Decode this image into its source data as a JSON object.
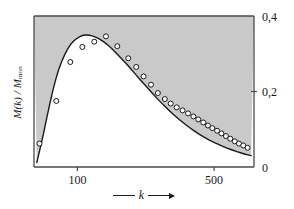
{
  "chart_data": {
    "type": "line",
    "title": "",
    "subtitle": "",
    "xlabel": "k",
    "xlabel_arrow": "⟶",
    "ylabel": "M(k) / M_mon",
    "ylabel_main": "M(k) / M",
    "ylabel_sub": "mon",
    "xscale": "log",
    "xlim": [
      60,
      800
    ],
    "ylim": [
      0,
      0.4
    ],
    "x_ticks": [
      100,
      500
    ],
    "x_tick_labels": [
      "100",
      "500"
    ],
    "y_ticks": [
      0,
      0.2,
      0.4
    ],
    "y_tick_labels": [
      "0",
      "0,2",
      "0,4"
    ],
    "y_axis_position": "right",
    "grid": false,
    "legend": false,
    "shaded_region": {
      "label": "area above curve",
      "color": "#c9c9c9",
      "description": "gray fill between the curve and the top/right frame"
    },
    "series": [
      {
        "name": "model curve",
        "type": "line",
        "color": "#1a1a1a",
        "linewidth": 1.4,
        "x": [
          62,
          66,
          70,
          75,
          80,
          86,
          92,
          99,
          106,
          114,
          122,
          131,
          141,
          151,
          162,
          174,
          187,
          200,
          215,
          231,
          248,
          266,
          286,
          307,
          330,
          354,
          380,
          408,
          438,
          470,
          505,
          542,
          582,
          625,
          671,
          720,
          773
        ],
        "y": [
          0.012,
          0.07,
          0.135,
          0.205,
          0.258,
          0.298,
          0.325,
          0.341,
          0.349,
          0.35,
          0.346,
          0.338,
          0.326,
          0.312,
          0.296,
          0.279,
          0.261,
          0.243,
          0.225,
          0.207,
          0.189,
          0.172,
          0.156,
          0.141,
          0.127,
          0.114,
          0.102,
          0.091,
          0.081,
          0.072,
          0.064,
          0.057,
          0.05,
          0.044,
          0.039,
          0.034,
          0.03
        ]
      },
      {
        "name": "measured data",
        "type": "scatter",
        "marker": "open-circle",
        "color": "#1a1a1a",
        "x": [
          64,
          78,
          92,
          106,
          122,
          140,
          160,
          182,
          200,
          218,
          238,
          258,
          280,
          300,
          322,
          345,
          368,
          392,
          415,
          440,
          465,
          490,
          518,
          545,
          575,
          605,
          638,
          670,
          705,
          742
        ],
        "y": [
          0.062,
          0.175,
          0.278,
          0.318,
          0.332,
          0.346,
          0.32,
          0.288,
          0.265,
          0.24,
          0.218,
          0.196,
          0.18,
          0.168,
          0.158,
          0.15,
          0.142,
          0.134,
          0.126,
          0.118,
          0.11,
          0.103,
          0.096,
          0.089,
          0.082,
          0.075,
          0.068,
          0.062,
          0.057,
          0.051
        ]
      }
    ]
  },
  "figure": {
    "background": "#ffffff",
    "frame_color": "#4a4a4a",
    "plot_area": {
      "left": 34,
      "top": 16,
      "right": 254,
      "bottom": 167
    }
  }
}
